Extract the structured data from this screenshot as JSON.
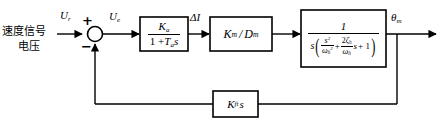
{
  "diagram": {
    "background": "#ffffff",
    "line_color": "#000000",
    "input_text_line1": "速度信号",
    "input_text_line2": "电压",
    "input_signal_label": "U",
    "input_signal_sub": "r",
    "error_signal_label": "U",
    "error_signal_sub": "e",
    "sum_plus": "+",
    "sum_minus_left": "−",
    "sum_minus_bottom": "−",
    "delta_i_label": "ΔI",
    "output_label": "θ",
    "output_sub": "m"
  },
  "blocks": {
    "amplifier": {
      "name": "amplifier-block",
      "numerator": "K",
      "numerator_sub": "a",
      "denominator_pre": "1 +",
      "denominator_T": "T",
      "denominator_T_sub": "a",
      "denominator_s": "s"
    },
    "motor": {
      "name": "motor-gain-block",
      "text_k": "K",
      "text_k_sub": "m",
      "text_slash": "/",
      "text_d": "D",
      "text_d_sub": "m"
    },
    "plant": {
      "name": "plant-block",
      "numerator": "1",
      "den_s": "s",
      "den_open_paren": "(",
      "den_close_paren": ")",
      "term1_num": "s",
      "term1_num_sup": "2",
      "term1_den_omega": "ω",
      "term1_den_sub": "h",
      "term1_den_sup": "2",
      "plus": "+",
      "term2_num_coef": "2",
      "term2_num_zeta": "ζ",
      "term2_num_sub": "h",
      "term2_den_omega": "ω",
      "term2_den_sub": "h",
      "term2_trailing_s": "s",
      "plus_one": "+ 1"
    },
    "feedback": {
      "name": "feedback-block",
      "text_k": "K",
      "text_k_sub": "ft",
      "text_s": "s"
    }
  }
}
